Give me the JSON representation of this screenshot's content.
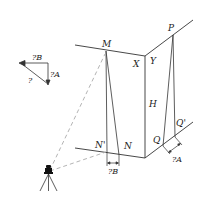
{
  "diagram": {
    "type": "surveying-building-corner",
    "labels": {
      "M": "M",
      "X": "X",
      "Y": "Y",
      "P": "P",
      "H": "H",
      "N_prime": "N'",
      "N": "N",
      "Q": "Q",
      "Q_prime": "Q'",
      "dB_bottom": "?B",
      "dA_bottom": "?A",
      "dB_legend": "?B",
      "dA_legend": "?A",
      "d_legend": "?"
    },
    "icons": {
      "instrument": "theodolite-tripod-icon"
    },
    "colors": {
      "line": "#333333",
      "dashed": "#aaaaaa",
      "text": "#222222"
    }
  }
}
